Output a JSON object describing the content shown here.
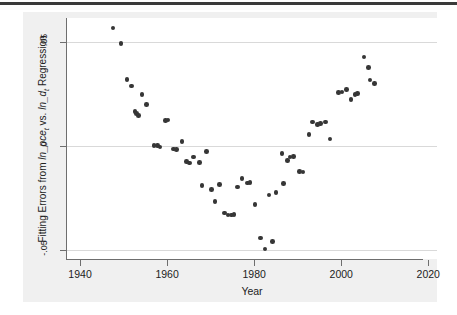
{
  "figure": {
    "background_color": "#ffffff",
    "panel_color": "#f0f0f0",
    "plot_color": "#ffffff",
    "marker_color": "#363636",
    "axis_color": "#6e6e6e",
    "grid_color": "#d9d9d9"
  },
  "chart_data": {
    "type": "scatter",
    "title": "",
    "xlabel": "Year",
    "ylabel": "Fitting Errors from ln_pce_t vs. ln_d_t Regression",
    "ylabel_parts": {
      "prefix": "Fitting Errors from ",
      "var1": "ln_pce",
      "var1_sub": "t",
      "middle": " vs. ",
      "var2": "ln_d",
      "var2_sub": "t",
      "suffix": " Regression"
    },
    "xlim": [
      1937,
      2022
    ],
    "ylim": [
      -0.0545,
      0.0615
    ],
    "xticks": [
      1940,
      1960,
      1980,
      2000,
      2020
    ],
    "xticklabels": [
      "1940",
      "1960",
      "1980",
      "2000",
      "2020"
    ],
    "yticks": [
      0.05,
      0,
      -0.05
    ],
    "yticklabels": [
      ".05",
      "0",
      "-.05"
    ],
    "grid": "horizontal",
    "legend": "none",
    "series": [
      {
        "name": "Fitting errors",
        "points": [
          [
            1947.6,
            0.0566
          ],
          [
            1949.4,
            0.0492
          ],
          [
            1950.8,
            0.032
          ],
          [
            1951.8,
            0.0287
          ],
          [
            1952.6,
            0.0164
          ],
          [
            1953.0,
            0.0155
          ],
          [
            1953.4,
            0.0145
          ],
          [
            1954.2,
            0.0248
          ],
          [
            1955.2,
            0.0198
          ],
          [
            1957.0,
            0.0002
          ],
          [
            1957.8,
            0.0
          ],
          [
            1958.4,
            -0.0005
          ],
          [
            1959.6,
            0.0122
          ],
          [
            1960.2,
            0.0125
          ],
          [
            1961.4,
            -0.0015
          ],
          [
            1962.2,
            -0.0017
          ],
          [
            1963.4,
            0.0021
          ],
          [
            1964.4,
            -0.0077
          ],
          [
            1965.2,
            -0.0083
          ],
          [
            1966.0,
            -0.0054
          ],
          [
            1967.4,
            -0.008
          ],
          [
            1968.0,
            -0.019
          ],
          [
            1969.0,
            -0.0028
          ],
          [
            1970.2,
            -0.021
          ],
          [
            1971.0,
            -0.0268
          ],
          [
            1972.0,
            -0.0186
          ],
          [
            1973.2,
            -0.0324
          ],
          [
            1974.0,
            -0.0334
          ],
          [
            1974.8,
            -0.0333
          ],
          [
            1975.4,
            -0.0332
          ],
          [
            1976.2,
            -0.0198
          ],
          [
            1977.2,
            -0.0157
          ],
          [
            1978.4,
            -0.018
          ],
          [
            1979.0,
            -0.0178
          ],
          [
            1980.2,
            -0.0283
          ],
          [
            1981.4,
            -0.0444
          ],
          [
            1982.5,
            -0.0497
          ],
          [
            1983.4,
            -0.0237
          ],
          [
            1984.2,
            -0.0462
          ],
          [
            1985.0,
            -0.0226
          ],
          [
            1986.4,
            -0.0037
          ],
          [
            1986.8,
            -0.0183
          ],
          [
            1987.6,
            -0.007
          ],
          [
            1988.2,
            -0.0055
          ],
          [
            1989.0,
            -0.0053
          ],
          [
            1990.4,
            -0.0123
          ],
          [
            1991.2,
            -0.0126
          ],
          [
            1992.6,
            0.0053
          ],
          [
            1993.4,
            0.0114
          ],
          [
            1994.6,
            0.0101
          ],
          [
            1995.2,
            0.0106
          ],
          [
            1996.4,
            0.0115
          ],
          [
            1997.4,
            0.0033
          ],
          [
            1999.4,
            0.0255
          ],
          [
            2000.2,
            0.0258
          ],
          [
            2001.2,
            0.0272
          ],
          [
            2002.2,
            0.0224
          ],
          [
            2003.2,
            0.0248
          ],
          [
            2003.8,
            0.0252
          ],
          [
            2005.2,
            0.0427
          ],
          [
            2006.2,
            0.0376
          ],
          [
            2006.6,
            0.0316
          ],
          [
            2007.6,
            0.03
          ]
        ]
      }
    ]
  }
}
